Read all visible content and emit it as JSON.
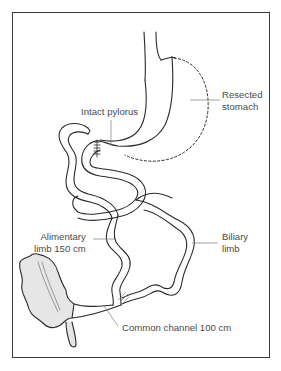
{
  "diagram": {
    "colors": {
      "frame": "#3a3a3a",
      "outline": "#2a2a2a",
      "leader": "#8a8a8a",
      "text": "#4a4a4a",
      "colon_fill": "#e6e6e6"
    },
    "labels": {
      "resected_stomach": {
        "line1": "Resected",
        "line2": "stomach"
      },
      "intact_pylorus": {
        "line1": "Intact pylorus"
      },
      "alimentary_limb": {
        "line1": "Alimentary",
        "line2": "limb 150 cm"
      },
      "biliary_limb": {
        "line1": "Biliary",
        "line2": "limb"
      },
      "common_channel": {
        "line1": "Common channel 100 cm"
      }
    },
    "structures": [
      "esophagus",
      "sleeve-stomach",
      "resected-stomach-outline",
      "pylorus-staple-line",
      "alimentary-limb",
      "biliary-limb",
      "common-channel",
      "anastomosis",
      "colon",
      "appendix"
    ]
  }
}
